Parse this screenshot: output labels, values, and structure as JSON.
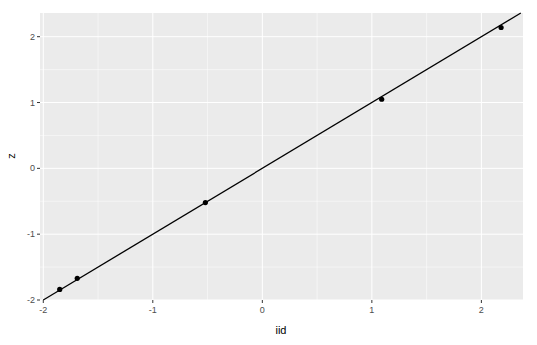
{
  "chart_data": {
    "type": "scatter",
    "title": "",
    "xlabel": "iid",
    "ylabel": "z",
    "x_ticks": [
      -2,
      -1,
      0,
      1,
      2
    ],
    "y_ticks": [
      -2,
      -1,
      0,
      1,
      2
    ],
    "x_tick_labels": [
      "-2",
      "-1",
      "0",
      "1",
      "2"
    ],
    "y_tick_labels": [
      "-2",
      "-1",
      "0",
      "1",
      "2"
    ],
    "xlim": [
      -2.03,
      2.38
    ],
    "ylim": [
      -2.0,
      2.36
    ],
    "grid": true,
    "legend": "none",
    "points": [
      {
        "x": -1.85,
        "y": -1.84
      },
      {
        "x": -1.69,
        "y": -1.67
      },
      {
        "x": -0.52,
        "y": -0.52
      },
      {
        "x": 1.09,
        "y": 1.05
      },
      {
        "x": 2.18,
        "y": 2.14
      }
    ],
    "reference_line": {
      "type": "abline",
      "slope": 1,
      "intercept": 0,
      "color": "#000000"
    },
    "colors": {
      "panel_background": "#ebebeb",
      "grid_major": "#ffffff",
      "point": "#000000",
      "line": "#000000"
    }
  }
}
